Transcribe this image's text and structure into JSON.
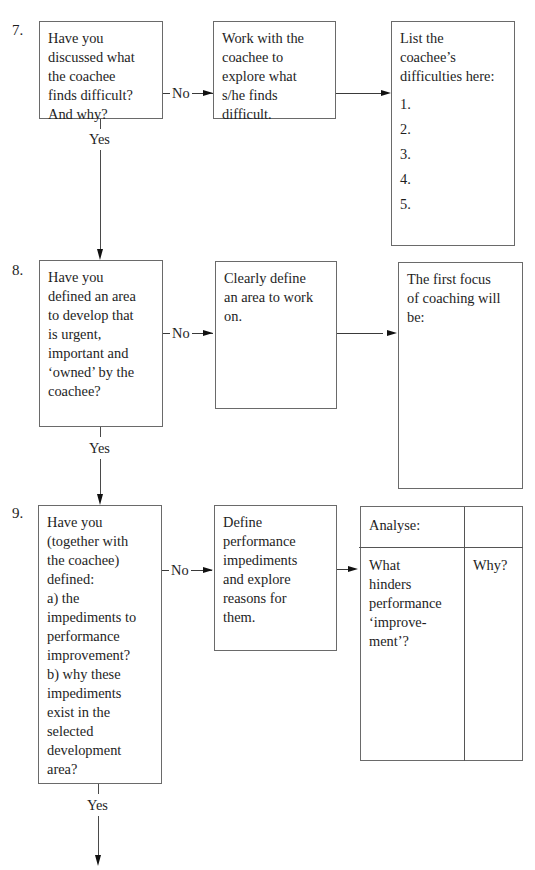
{
  "steps": [
    {
      "number": "7.",
      "question": [
        "Have you",
        "discussed what",
        "the coachee",
        "finds difficult?",
        "And why?"
      ],
      "no_label": "No",
      "yes_label": "Yes",
      "action": [
        "Work with the",
        "coachee to",
        "explore what",
        "s/he finds",
        "difficult."
      ],
      "output": {
        "heading": [
          "List the",
          "coachee’s",
          "difficulties here:"
        ],
        "items": [
          "1.",
          "2.",
          "3.",
          "4.",
          "5."
        ]
      }
    },
    {
      "number": "8.",
      "question": [
        "Have you",
        "defined an area",
        "to develop that",
        "is urgent,",
        "important and",
        "‘owned’ by the",
        "coachee?"
      ],
      "no_label": "No",
      "yes_label": "Yes",
      "action": [
        "Clearly define",
        "an area to work",
        "on."
      ],
      "output": {
        "heading": [
          "The first focus",
          "of coaching will",
          "be:"
        ]
      }
    },
    {
      "number": "9.",
      "question": [
        "Have you",
        "(together with",
        "the coachee)",
        "defined:",
        "a) the",
        "impediments to",
        "performance",
        "improvement?",
        "b) why these",
        "impediments",
        "exist in the",
        "selected",
        "development",
        "area?"
      ],
      "no_label": "No",
      "yes_label": "Yes",
      "action": [
        "Define",
        "performance",
        "impediments",
        "and explore",
        "reasons for",
        "them."
      ],
      "output": {
        "table_header": [
          "Analyse:",
          ""
        ],
        "col1": [
          "What",
          "hinders",
          "performance",
          "‘improve-",
          "ment’?"
        ],
        "col2": [
          "Why?"
        ]
      }
    }
  ]
}
